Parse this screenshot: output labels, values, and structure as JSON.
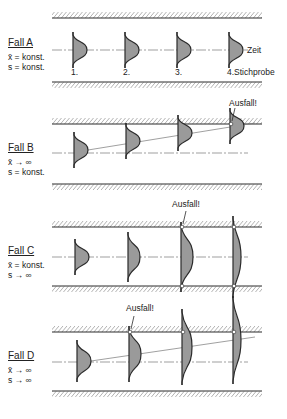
{
  "colors": {
    "ink": "#2a2a2a",
    "fill": "#9a9a9a",
    "hatch": "#555555",
    "background": "#ffffff"
  },
  "labels": {
    "zeit": "Zeit",
    "stichprobe": "4.Stichprobe",
    "sample_numbers": [
      "1.",
      "2.",
      "3."
    ],
    "ausfall": "Ausfall!"
  },
  "cases": [
    {
      "id": "A",
      "title": "Fall A",
      "line1": "x̄ = konst.",
      "line2": "s = konst.",
      "top": 18,
      "bottom": 82,
      "center": 50,
      "samples": [
        {
          "x": 73,
          "cy": 50,
          "h": 30,
          "w": 14
        },
        {
          "x": 125,
          "cy": 50,
          "h": 30,
          "w": 14
        },
        {
          "x": 177,
          "cy": 50,
          "h": 30,
          "w": 14
        },
        {
          "x": 229,
          "cy": 50,
          "h": 30,
          "w": 14
        }
      ],
      "failure_index": null
    },
    {
      "id": "B",
      "title": "Fall B",
      "line1": "x̄ → ∞",
      "line2": "s = konst.",
      "top": 124,
      "bottom": 184,
      "center": 153,
      "samples": [
        {
          "x": 74,
          "cy": 150,
          "h": 30,
          "w": 14
        },
        {
          "x": 126,
          "cy": 141,
          "h": 30,
          "w": 14
        },
        {
          "x": 178,
          "cy": 133,
          "h": 30,
          "w": 14
        },
        {
          "x": 230,
          "cy": 126,
          "h": 30,
          "w": 14
        }
      ],
      "failure_index": 3
    },
    {
      "id": "C",
      "title": "Fall C",
      "line1": "x̄ = konst.",
      "line2": "s → ∞",
      "top": 227,
      "bottom": 286,
      "center": 257,
      "samples": [
        {
          "x": 75,
          "cy": 257,
          "h": 30,
          "w": 14
        },
        {
          "x": 128,
          "cy": 257,
          "h": 44,
          "w": 12
        },
        {
          "x": 181,
          "cy": 257,
          "h": 64,
          "w": 12
        },
        {
          "x": 233,
          "cy": 257,
          "h": 76,
          "w": 8
        }
      ],
      "failure_index": 2
    },
    {
      "id": "D",
      "title": "Fall D",
      "line1": "x̄ → ∞",
      "line2": "s → ∞",
      "top": 332,
      "bottom": 391,
      "center": 362,
      "samples": [
        {
          "x": 77,
          "cy": 361,
          "h": 36,
          "w": 14
        },
        {
          "x": 129,
          "cy": 354,
          "h": 50,
          "w": 12
        },
        {
          "x": 182,
          "cy": 347,
          "h": 70,
          "w": 10
        },
        {
          "x": 233,
          "cy": 340,
          "h": 82,
          "w": 8
        }
      ],
      "failure_index": 1
    }
  ]
}
